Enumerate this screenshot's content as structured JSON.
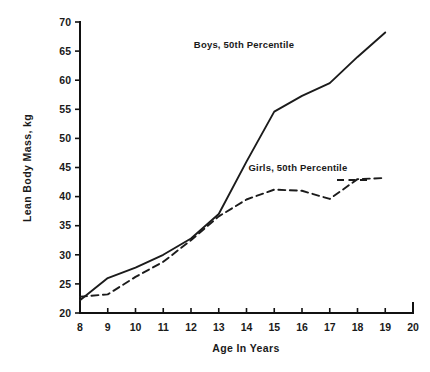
{
  "chart_data": {
    "type": "line",
    "title": "",
    "xlabel": "Age In Years",
    "ylabel": "Lean Body Mass, kg",
    "xlim": [
      8,
      20
    ],
    "ylim": [
      20,
      70
    ],
    "xticks": [
      8,
      9,
      10,
      11,
      12,
      13,
      14,
      15,
      16,
      17,
      18,
      19,
      20
    ],
    "yticks": [
      20,
      25,
      30,
      35,
      40,
      45,
      50,
      55,
      60,
      65,
      70
    ],
    "grid": false,
    "legend_position": "inline-annotation",
    "x": [
      8,
      9,
      10,
      11,
      12,
      13,
      14,
      15,
      16,
      17,
      18,
      19
    ],
    "series": [
      {
        "name": "Boys, 50th Percentile",
        "style": "solid",
        "color": "#1b1b1b",
        "label_annotation": "Boys, 50th Percentile",
        "values": [
          22.2,
          26.0,
          27.8,
          30.0,
          32.8,
          37.0,
          46.0,
          54.6,
          57.3,
          59.5,
          64.0,
          68.2
        ]
      },
      {
        "name": "Girls, 50th Percentile",
        "style": "dashed",
        "color": "#1b1b1b",
        "label_annotation": "Girls, 50th Percentile",
        "values": [
          22.8,
          23.2,
          26.2,
          28.8,
          32.5,
          36.6,
          39.5,
          41.2,
          41.0,
          39.6,
          43.0,
          43.2
        ]
      }
    ]
  },
  "annotations": {
    "boys_label": "Boys, 50th Percentile",
    "girls_label": "Girls, 50th Percentile"
  },
  "axis": {
    "x_title": "Age In Years",
    "y_title": "Lean Body Mass, kg",
    "x_tick_labels": [
      "8",
      "9",
      "10",
      "11",
      "12",
      "13",
      "14",
      "15",
      "16",
      "17",
      "18",
      "19",
      "20"
    ],
    "y_tick_labels": [
      "20",
      "25",
      "30",
      "35",
      "40",
      "45",
      "50",
      "55",
      "60",
      "65",
      "70"
    ]
  }
}
